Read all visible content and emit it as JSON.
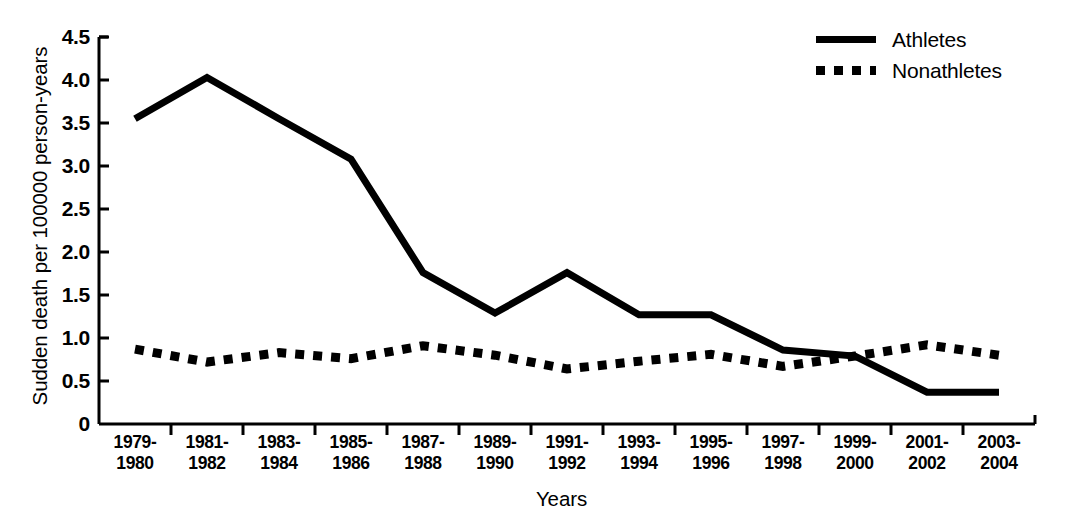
{
  "chart_data": {
    "type": "line",
    "title": "",
    "xlabel": "Years",
    "ylabel": "Sudden death per 100000 person-years",
    "categories": [
      "1979-\n1980",
      "1981-\n1982",
      "1983-\n1984",
      "1985-\n1986",
      "1987-\n1988",
      "1989-\n1990",
      "1991-\n1992",
      "1993-\n1994",
      "1995-\n1996",
      "1997-\n1998",
      "1999-\n2000",
      "2001-\n2002",
      "2003-\n2004"
    ],
    "category_lines": [
      [
        "1979-",
        "1980"
      ],
      [
        "1981-",
        "1982"
      ],
      [
        "1983-",
        "1984"
      ],
      [
        "1985-",
        "1986"
      ],
      [
        "1987-",
        "1988"
      ],
      [
        "1989-",
        "1990"
      ],
      [
        "1991-",
        "1992"
      ],
      [
        "1993-",
        "1994"
      ],
      [
        "1995-",
        "1996"
      ],
      [
        "1997-",
        "1998"
      ],
      [
        "1999-",
        "2000"
      ],
      [
        "2001-",
        "2002"
      ],
      [
        "2003-",
        "2004"
      ]
    ],
    "series": [
      {
        "name": "Athletes",
        "style": "solid",
        "color": "#000000",
        "values": [
          3.55,
          4.03,
          3.55,
          3.08,
          1.76,
          1.29,
          1.76,
          1.27,
          1.27,
          0.86,
          0.79,
          0.37,
          0.37
        ]
      },
      {
        "name": "Nonathletes",
        "style": "dotted",
        "color": "#000000",
        "values": [
          0.87,
          0.72,
          0.83,
          0.76,
          0.91,
          0.8,
          0.64,
          0.73,
          0.81,
          0.67,
          0.79,
          0.92,
          0.8
        ]
      }
    ],
    "ylim": [
      0,
      4.5
    ],
    "yticks": [
      0,
      0.5,
      1.0,
      1.5,
      2.0,
      2.5,
      3.0,
      3.5,
      4.0,
      4.5
    ],
    "ytick_labels": [
      "0",
      "0.5",
      "1.0",
      "1.5",
      "2.0",
      "2.5",
      "3.0",
      "3.5",
      "4.0",
      "4.5"
    ],
    "grid": false,
    "legend_position": "top-right",
    "axis_color": "#000000",
    "background": "#ffffff"
  },
  "legend": {
    "entries": [
      {
        "label": "Athletes",
        "style": "solid"
      },
      {
        "label": "Nonathletes",
        "style": "dotted"
      }
    ]
  }
}
